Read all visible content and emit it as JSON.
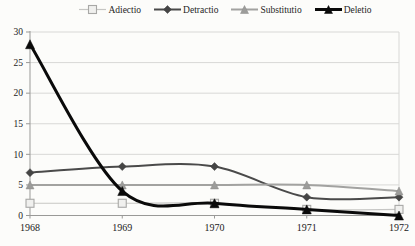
{
  "chart_data": {
    "type": "line",
    "title": "",
    "xlabel": "",
    "ylabel": "",
    "categories": [
      "1968",
      "1969",
      "1970",
      "1971",
      "1972"
    ],
    "series": [
      {
        "name": "Adiectio",
        "values": [
          2,
          2,
          2,
          1,
          1
        ],
        "color": "#c6c6c4",
        "marker": "square-open",
        "marker_fill": "#f0f0ee",
        "marker_stroke": "#a8a8a6",
        "line_width": 1.2,
        "marker_size": 8
      },
      {
        "name": "Detractio",
        "values": [
          7,
          8,
          8,
          3,
          3
        ],
        "color": "#4a4a4a",
        "marker": "diamond",
        "marker_fill": "#454545",
        "marker_stroke": "#454545",
        "line_width": 2,
        "marker_size": 8
      },
      {
        "name": "Substitutio",
        "values": [
          5,
          5,
          5,
          5,
          4
        ],
        "color": "#a2a2a0",
        "marker": "triangle",
        "marker_fill": "#9c9c9a",
        "marker_stroke": "#8c8c8a",
        "line_width": 2,
        "marker_size": 8
      },
      {
        "name": "Deletio",
        "values": [
          28,
          4,
          2,
          1,
          0
        ],
        "color": "#0a0a0a",
        "marker": "triangle",
        "marker_fill": "#0a0a0a",
        "marker_stroke": "#0a0a0a",
        "line_width": 3,
        "marker_size": 9
      }
    ],
    "ylim": [
      0,
      30
    ],
    "yticks": [
      0,
      5,
      10,
      15,
      20,
      25,
      30
    ],
    "grid": true,
    "grid_color": "#d8d8d6",
    "axis_color": "#999997",
    "tick_label_color": "#222222",
    "legend_position": "top"
  }
}
